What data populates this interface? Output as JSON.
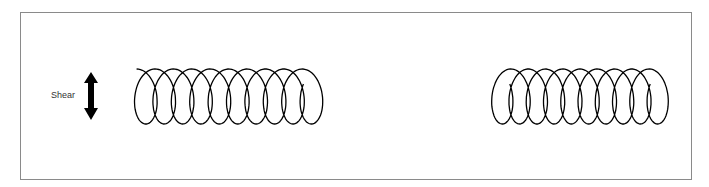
{
  "diagram": {
    "label": "Shear",
    "arrow": {
      "direction": "vertical-double",
      "color": "#000000"
    },
    "coils": [
      {
        "name": "coil-sheared",
        "loops": 10,
        "x_start": 121,
        "x_end": 316,
        "y_top": 69,
        "y_bottom": 124,
        "open_start_tail": true
      },
      {
        "name": "coil-unsheared",
        "loops": 10,
        "x_start": 479,
        "x_end": 662,
        "y_top": 69,
        "y_bottom": 124,
        "open_start_tail": false
      }
    ],
    "frame_color": "#8a8a8a",
    "stroke_color": "#000000"
  }
}
